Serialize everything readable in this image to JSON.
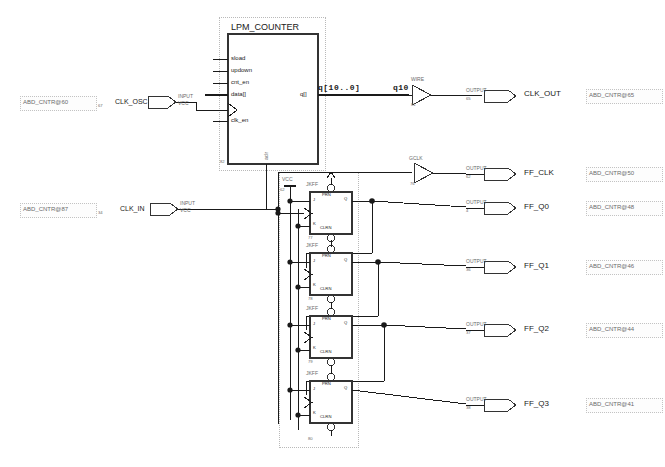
{
  "sheet": {
    "title": "ABD_CNTR schematic sheet",
    "wire_color": "#1a1a1a",
    "dash_color": "#b9b9b9"
  },
  "counter_block": {
    "name": "LPM_COUNTER",
    "instance": "82",
    "inputs": [
      "sload",
      "updown",
      "cnt_en",
      "data[]",
      "clk_en"
    ],
    "clock_pin_name": "clock",
    "bottom_pin": "aclr",
    "output_pin": "q[]"
  },
  "bus": {
    "label": "q[10..0]",
    "node": "q10"
  },
  "buffers": [
    {
      "type": "WIRE",
      "instance": "81"
    },
    {
      "type": "GCLK",
      "instance": "76"
    }
  ],
  "vcc_symbol": {
    "label": "VCC",
    "instance": "62"
  },
  "inputs": [
    {
      "port_label": "INPUT",
      "port_default": "VCC",
      "instance": "67",
      "signal": "CLK_OSC",
      "anno": "ABD_CNTR@60"
    },
    {
      "port_label": "INPUT",
      "port_default": "VCC",
      "instance": "34",
      "signal": "CLK_IN",
      "anno": "ABD_CNTR@87"
    }
  ],
  "outputs": [
    {
      "port_label": "OUTPUT",
      "instance": "65",
      "signal": "CLK_OUT",
      "anno": "ABD_CNTR@65"
    },
    {
      "port_label": "OUTPUT",
      "instance": "62",
      "signal": "FF_CLK",
      "anno": "ABD_CNTR@50"
    },
    {
      "port_label": "OUTPUT",
      "instance": "4",
      "signal": "FF_Q0",
      "anno": "ABD_CNTR@48"
    },
    {
      "port_label": "OUTPUT",
      "instance": "36",
      "signal": "FF_Q1",
      "anno": "ABD_CNTR@46"
    },
    {
      "port_label": "OUTPUT",
      "instance": "37",
      "signal": "FF_Q2",
      "anno": "ABD_CNTR@44"
    },
    {
      "port_label": "OUTPUT",
      "instance": "38",
      "signal": "FF_Q3",
      "anno": "ABD_CNTR@41"
    }
  ],
  "flipflops": [
    {
      "type": "JKFF",
      "instance": "77",
      "pin_prn": "PRN",
      "pin_j": "J",
      "pin_k": "K",
      "pin_clrn": "CLRN",
      "pin_q": "Q"
    },
    {
      "type": "JKFF",
      "instance": "78",
      "pin_prn": "PRN",
      "pin_j": "J",
      "pin_k": "K",
      "pin_clrn": "CLRN",
      "pin_q": "Q"
    },
    {
      "type": "JKFF",
      "instance": "79",
      "pin_prn": "PRN",
      "pin_j": "J",
      "pin_k": "K",
      "pin_clrn": "CLRN",
      "pin_q": "Q"
    },
    {
      "type": "JKFF",
      "instance": "80",
      "pin_prn": "PRN",
      "pin_j": "J",
      "pin_k": "K",
      "pin_clrn": "CLRN",
      "pin_q": "Q"
    }
  ]
}
